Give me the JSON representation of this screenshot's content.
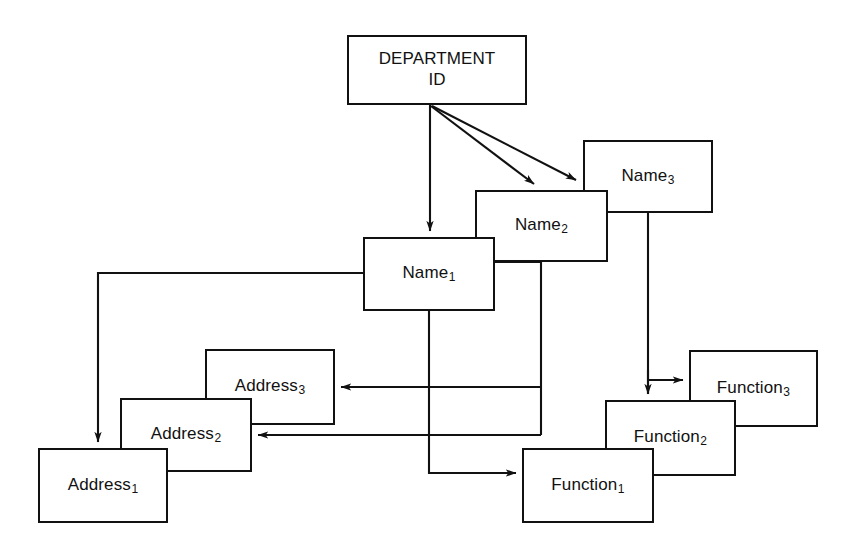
{
  "diagram": {
    "kind": "entity-decomposition-diagram",
    "background_color": "#ffffff",
    "line_color": "#111111",
    "canvas": {
      "width": 850,
      "height": 555
    },
    "nodes": [
      {
        "id": "department-id",
        "text": "DEPARTMENT\nID",
        "base": "DEPARTMENT ID",
        "subscript": "",
        "x": 347,
        "y": 35,
        "w": 180,
        "h": 70
      },
      {
        "id": "name-3",
        "text": "Name3",
        "base": "Name",
        "subscript": "3",
        "x": 583,
        "y": 140,
        "w": 130,
        "h": 73
      },
      {
        "id": "name-2",
        "text": "Name2",
        "base": "Name",
        "subscript": "2",
        "x": 475,
        "y": 190,
        "w": 133,
        "h": 72
      },
      {
        "id": "name-1",
        "text": "Name1",
        "base": "Name",
        "subscript": "1",
        "x": 363,
        "y": 237,
        "w": 132,
        "h": 74
      },
      {
        "id": "address-3",
        "text": "Address3",
        "base": "Address",
        "subscript": "3",
        "x": 205,
        "y": 349,
        "w": 130,
        "h": 76
      },
      {
        "id": "address-2",
        "text": "Address2",
        "base": "Address",
        "subscript": "2",
        "x": 120,
        "y": 398,
        "w": 132,
        "h": 74
      },
      {
        "id": "address-1",
        "text": "Address1",
        "base": "Address",
        "subscript": "1",
        "x": 38,
        "y": 448,
        "w": 130,
        "h": 75
      },
      {
        "id": "function-3",
        "text": "Function3",
        "base": "Function",
        "subscript": "3",
        "x": 689,
        "y": 350,
        "w": 129,
        "h": 77
      },
      {
        "id": "function-2",
        "text": "Function2",
        "base": "Function",
        "subscript": "2",
        "x": 605,
        "y": 400,
        "w": 131,
        "h": 76
      },
      {
        "id": "function-1",
        "text": "Function1",
        "base": "Function",
        "subscript": "1",
        "x": 522,
        "y": 448,
        "w": 132,
        "h": 75
      }
    ],
    "edges": [
      {
        "id": "dept-to-name-1",
        "from": "department-id",
        "to": "name-1",
        "arrow": true
      },
      {
        "id": "dept-to-name-2",
        "from": "department-id",
        "to": "name-2",
        "arrow": true
      },
      {
        "id": "dept-to-name-3",
        "from": "department-id",
        "to": "name-3",
        "arrow": true
      },
      {
        "id": "name-1-to-address-1",
        "from": "name-1",
        "to": "address-1",
        "arrow": true
      },
      {
        "id": "name-1-to-function-1",
        "from": "name-1",
        "to": "function-1",
        "arrow": true
      },
      {
        "id": "name-2-to-address-3",
        "from": "name-2",
        "to": "address-3",
        "arrow": true
      },
      {
        "id": "name-2-to-address-2",
        "from": "name-2",
        "to": "address-2",
        "arrow": true
      },
      {
        "id": "name-3-to-function-3",
        "from": "name-3",
        "to": "function-3",
        "arrow": true
      },
      {
        "id": "name-3-to-function-2",
        "from": "name-3",
        "to": "function-2",
        "arrow": true
      }
    ]
  }
}
